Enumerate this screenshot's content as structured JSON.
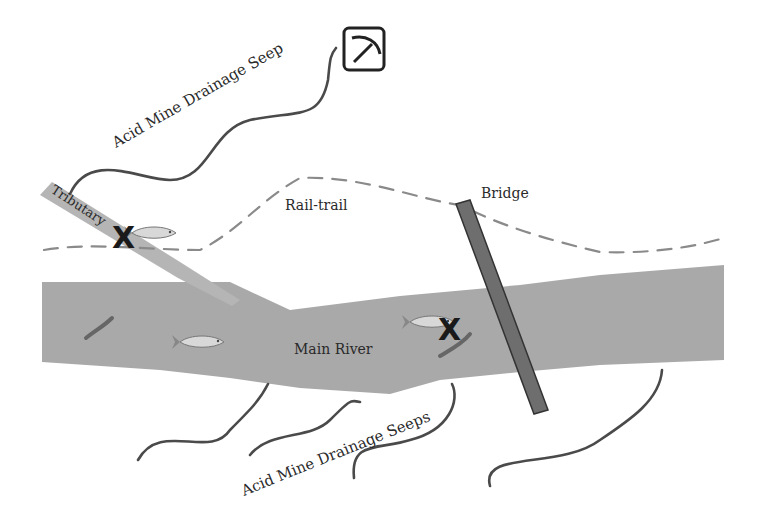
{
  "diagram": {
    "labels": {
      "upper_seep": "Acid Mine Drainage Seep",
      "tributary": "Tributary",
      "rail_trail": "Rail-trail",
      "bridge": "Bridge",
      "main_river": "Main River",
      "lower_seeps": "Acid Mine Drainage Seeps"
    },
    "icons": {
      "mine": "pickaxe-icon",
      "impaired_marker": "X"
    },
    "colors": {
      "river": "#a9a9a9",
      "bridge": "#6e6e6e",
      "seep_line": "#4a4a4a",
      "trail": "#8a8a8a",
      "text": "#2a2a2a"
    }
  }
}
